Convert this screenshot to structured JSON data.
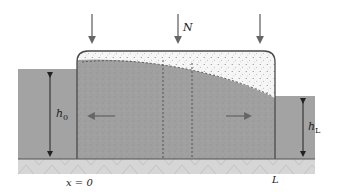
{
  "figure": {
    "type": "schematic",
    "labels": {
      "load": "N",
      "left_head": "h",
      "left_head_sub": "0",
      "right_head": "h",
      "right_head_sub": "L",
      "origin": "x = 0",
      "length": "L"
    },
    "load_arrows": 3,
    "flow_arrows": [
      "left",
      "right"
    ],
    "colors": {
      "water": "#a3a3a3",
      "soil": "#9e9e9e",
      "soil_light": "#f4f4f4",
      "base": "#d4d4d4",
      "outline": "#4a4a4a",
      "arrow": "#6a6a6a"
    }
  }
}
